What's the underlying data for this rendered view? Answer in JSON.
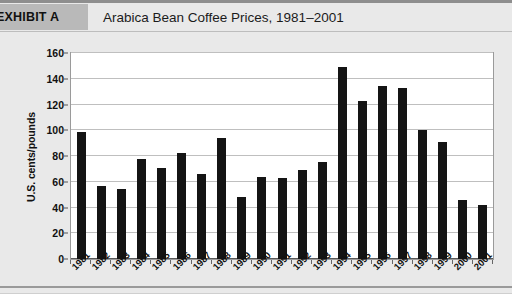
{
  "header": {
    "exhibit_label": "EXHIBIT A",
    "title": "Arabica Bean Coffee Prices, 1981–2001"
  },
  "colors": {
    "page_background": "#e9e9e9",
    "exhibit_band": "#b9b9b9",
    "plot_background": "#ffffff",
    "bar_color": "#141414",
    "gridline": "#bfbfbf",
    "axis": "#5a5a5a"
  },
  "chart_data": {
    "type": "bar",
    "title": "Arabica Bean Coffee Prices, 1981–2001",
    "xlabel": "",
    "ylabel": "U.S. cents/pounds",
    "ylim": [
      0,
      160
    ],
    "ytick_step": 20,
    "yticks": [
      0,
      20,
      40,
      60,
      80,
      100,
      120,
      140,
      160
    ],
    "grid": true,
    "legend": "none",
    "categories": [
      "1981",
      "1982",
      "1983",
      "1984",
      "1985",
      "1986",
      "1987",
      "1988",
      "1989",
      "1990",
      "1991",
      "1992",
      "1993",
      "1994",
      "1995",
      "1996",
      "1997",
      "1998",
      "1999",
      "2000",
      "2001"
    ],
    "values": [
      99,
      57,
      54,
      78,
      71,
      82,
      66,
      94,
      48,
      64,
      63,
      69,
      75,
      149,
      123,
      134,
      133,
      100,
      91,
      46,
      42
    ]
  }
}
